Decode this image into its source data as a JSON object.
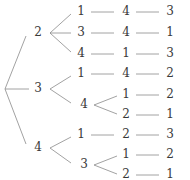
{
  "diagram": {
    "type": "tree",
    "root": {
      "label": "",
      "x": 5,
      "y": 89
    },
    "nodes": [
      {
        "id": "a2",
        "label": "2",
        "x": 38,
        "y": 33
      },
      {
        "id": "a3",
        "label": "3",
        "x": 38,
        "y": 89
      },
      {
        "id": "a4",
        "label": "4",
        "x": 38,
        "y": 148
      },
      {
        "id": "b21",
        "label": "1",
        "x": 81,
        "y": 12
      },
      {
        "id": "b23",
        "label": "3",
        "x": 81,
        "y": 33
      },
      {
        "id": "b24",
        "label": "4",
        "x": 81,
        "y": 54
      },
      {
        "id": "b31",
        "label": "1",
        "x": 81,
        "y": 74
      },
      {
        "id": "b34",
        "label": "4",
        "x": 81,
        "y": 105
      },
      {
        "id": "b41",
        "label": "1",
        "x": 81,
        "y": 135
      },
      {
        "id": "b43",
        "label": "3",
        "x": 81,
        "y": 165
      },
      {
        "id": "c214",
        "label": "4",
        "x": 126,
        "y": 12
      },
      {
        "id": "c234",
        "label": "4",
        "x": 126,
        "y": 33
      },
      {
        "id": "c241",
        "label": "1",
        "x": 126,
        "y": 54
      },
      {
        "id": "c314",
        "label": "4",
        "x": 126,
        "y": 74
      },
      {
        "id": "c341",
        "label": "1",
        "x": 126,
        "y": 95
      },
      {
        "id": "c342",
        "label": "2",
        "x": 126,
        "y": 115
      },
      {
        "id": "c412",
        "label": "2",
        "x": 126,
        "y": 135
      },
      {
        "id": "c431",
        "label": "1",
        "x": 126,
        "y": 155
      },
      {
        "id": "c432",
        "label": "2",
        "x": 126,
        "y": 175
      },
      {
        "id": "d2143",
        "label": "3",
        "x": 170,
        "y": 12
      },
      {
        "id": "d2341",
        "label": "1",
        "x": 170,
        "y": 33
      },
      {
        "id": "d2413",
        "label": "3",
        "x": 170,
        "y": 54
      },
      {
        "id": "d3142",
        "label": "2",
        "x": 170,
        "y": 74
      },
      {
        "id": "d3412",
        "label": "2",
        "x": 170,
        "y": 95
      },
      {
        "id": "d3421",
        "label": "1",
        "x": 170,
        "y": 115
      },
      {
        "id": "d4123",
        "label": "3",
        "x": 170,
        "y": 135
      },
      {
        "id": "d4312",
        "label": "2",
        "x": 170,
        "y": 155
      },
      {
        "id": "d4321",
        "label": "1",
        "x": 170,
        "y": 175
      }
    ],
    "paths": [
      "2-1-4-3",
      "2-3-4-1",
      "2-4-1-3",
      "3-1-4-2",
      "3-4-1-2",
      "3-4-2-1",
      "4-1-2-3",
      "4-3-1-2",
      "4-3-2-1"
    ],
    "edge_color": "#8a8a8a",
    "text_color": "#3a3a3a"
  }
}
